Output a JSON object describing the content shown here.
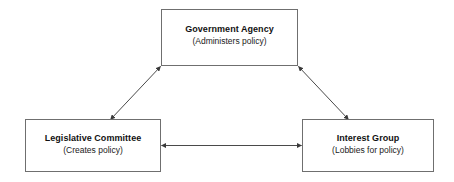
{
  "diagram": {
    "type": "triangle-relationship-diagram",
    "background_color": "#ffffff",
    "line_color": "#4a4a4a",
    "box_border_color": "#6f6f6f",
    "text_color": "#111111",
    "nodes": [
      {
        "id": "government-agency",
        "title": "Government Agency",
        "subtitle": "(Administers policy)",
        "position": "top-center"
      },
      {
        "id": "legislative-committee",
        "title": "Legislative Committee",
        "subtitle": "(Creates policy)",
        "position": "bottom-left"
      },
      {
        "id": "interest-group",
        "title": "Interest Group",
        "subtitle": "(Lobbies for policy)",
        "position": "bottom-right"
      }
    ],
    "edges": [
      {
        "id": "edge-agency-committee",
        "from": "government-agency",
        "to": "legislative-committee",
        "arrowheads": "both",
        "label": ""
      },
      {
        "id": "edge-agency-interest",
        "from": "government-agency",
        "to": "interest-group",
        "arrowheads": "both",
        "label": ""
      },
      {
        "id": "edge-committee-interest",
        "from": "legislative-committee",
        "to": "interest-group",
        "arrowheads": "both",
        "label": ""
      }
    ]
  }
}
